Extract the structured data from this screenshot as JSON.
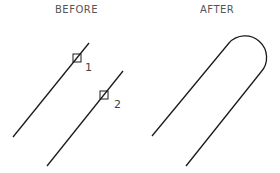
{
  "before": {
    "title": "BEFORE",
    "point1_label": "1",
    "point2_label": "2"
  },
  "after": {
    "title": "AFTER"
  },
  "colors": {
    "line": "#1a1a1a",
    "text": "#555555"
  }
}
